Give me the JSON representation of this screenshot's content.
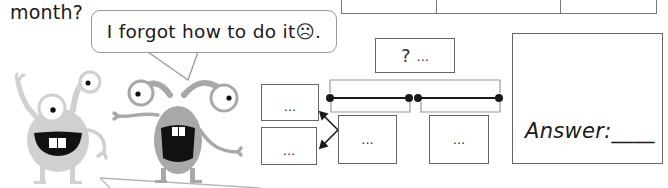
{
  "question": {
    "text_fragment": "month?"
  },
  "top_table": {
    "columns": 3,
    "cells": [
      "",
      "",
      ""
    ]
  },
  "speech_bubble": {
    "text": "I forgot how to do it☹."
  },
  "diagram": {
    "total_box": {
      "symbol": "?",
      "value": "..."
    },
    "left_boxes": [
      {
        "value": "..."
      },
      {
        "value": "..."
      }
    ],
    "segment_boxes": [
      {
        "value": "..."
      },
      {
        "value": "..."
      }
    ],
    "colors": {
      "line": "#1a1a1a",
      "bracket": "#999999",
      "box_border": "#666666"
    }
  },
  "answer": {
    "label": "Answer:",
    "blank": "____"
  },
  "characters": [
    {
      "name": "light-gray-monster",
      "color": "#cfcfcf"
    },
    {
      "name": "gray-monster",
      "color": "#a6a6a6"
    }
  ]
}
